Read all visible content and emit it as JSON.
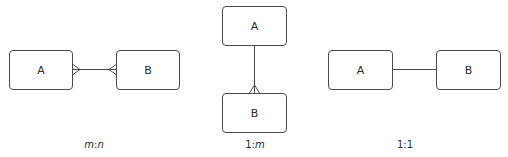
{
  "diagrams": [
    {
      "id": "many-to-many",
      "caption": {
        "left": "m",
        "sep": ":",
        "right": "n",
        "italic_left": true,
        "italic_right": true
      },
      "entities": [
        {
          "label": "A",
          "x": 9,
          "y": 50,
          "w": 64,
          "h": 40
        },
        {
          "label": "B",
          "x": 116,
          "y": 50,
          "w": 64,
          "h": 40
        }
      ],
      "relationship": {
        "type": "m:n",
        "left_end": "crows-foot",
        "right_end": "crows-foot"
      }
    },
    {
      "id": "one-to-many",
      "caption": {
        "left": "1",
        "sep": ":",
        "right": "m",
        "italic_left": false,
        "italic_right": true
      },
      "entities": [
        {
          "label": "A",
          "x": 222,
          "y": 6,
          "w": 65,
          "h": 40
        },
        {
          "label": "B",
          "x": 222,
          "y": 93,
          "w": 65,
          "h": 40
        }
      ],
      "relationship": {
        "type": "1:m",
        "top_end": "one",
        "bottom_end": "crows-foot"
      }
    },
    {
      "id": "one-to-one",
      "caption": {
        "left": "1",
        "sep": ":",
        "right": "1",
        "italic_left": false,
        "italic_right": false
      },
      "entities": [
        {
          "label": "A",
          "x": 328,
          "y": 50,
          "w": 65,
          "h": 40
        },
        {
          "label": "B",
          "x": 436,
          "y": 50,
          "w": 65,
          "h": 40
        }
      ],
      "relationship": {
        "type": "1:1",
        "left_end": "one",
        "right_end": "one"
      }
    }
  ],
  "colors": {
    "stroke": "#4a4a4a",
    "text": "#2b2b2b",
    "background": "#ffffff"
  }
}
